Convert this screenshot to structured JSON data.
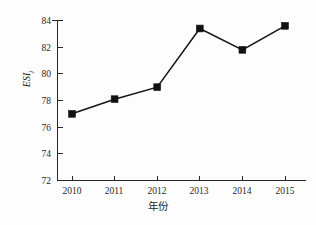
{
  "chart_data": {
    "type": "line",
    "title": "",
    "subtitle": "",
    "xlabel": "年份",
    "ylabel": "ESI",
    "ylabel_subscript": "j",
    "categories": [
      "2010",
      "2011",
      "2012",
      "2013",
      "2014",
      "2015"
    ],
    "x": [
      2010,
      2011,
      2012,
      2013,
      2014,
      2015
    ],
    "values": [
      77.0,
      78.1,
      79.0,
      83.4,
      81.8,
      83.6
    ],
    "series": [
      {
        "name": "ESI",
        "values": [
          77.0,
          78.1,
          79.0,
          83.4,
          81.8,
          83.6
        ],
        "marker": "square",
        "color": "#111111"
      }
    ],
    "ylim": [
      72,
      84
    ],
    "yticks": [
      72,
      74,
      76,
      78,
      80,
      82,
      84
    ],
    "ytick_labels": [
      "72",
      "74",
      "76",
      "78",
      "80",
      "82",
      "84"
    ],
    "xtick_labels": [
      "2010",
      "2011",
      "2012",
      "2013",
      "2014",
      "2015"
    ],
    "grid": false,
    "legend": false,
    "legend_position": "none",
    "line_color": "#111111",
    "marker_color": "#111111",
    "axis_color": "#262626",
    "background_color": "#fdfdfd"
  }
}
